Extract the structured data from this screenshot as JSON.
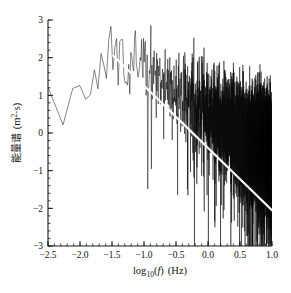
{
  "chart_data": {
    "type": "line",
    "title": "",
    "subtitle": "",
    "xlabel": "log_10(f)  (Hz)",
    "xlabel_parts": {
      "log": "log",
      "base": "10",
      "open": "(",
      "variable": "f",
      "close": ")",
      "unit": "(Hz)"
    },
    "ylabel": "能量谱 (m²·s)",
    "ylabel_parts": {
      "cjk": "能量谱",
      "unit_open": "(m",
      "unit_sup": "2",
      "unit_mid": "·s",
      "unit_close": ")"
    },
    "xlim": [
      -2.5,
      1.0
    ],
    "ylim": [
      -3,
      3
    ],
    "xticks": [
      -2.5,
      -2.0,
      -1.5,
      -1.0,
      -0.5,
      0.0,
      0.5,
      1.0
    ],
    "xtick_labels": [
      "-2.5",
      "-2.0",
      "-1.5",
      "-1.0",
      "-0.5",
      "0.0",
      "0.5",
      "1.0"
    ],
    "yticks": [
      -3,
      -2,
      -1,
      0,
      1,
      2,
      3
    ],
    "ytick_labels": [
      "-3",
      "-2",
      "-1",
      "0",
      "1",
      "2",
      "3"
    ],
    "x_minor_interval": 0.1,
    "y_minor_interval": 0.2,
    "grid": false,
    "legend": false,
    "series": [
      {
        "name": "energy-spectrum",
        "color": "#0a0a0a",
        "description": "noisy wave energy density spectrum",
        "peak_x": -1.5,
        "peak_y": 2.25,
        "start_x": -2.5,
        "start_y": 1.2,
        "end_x": 1.0,
        "end_y": -2.6,
        "envelope": [
          {
            "x": -2.5,
            "y": 1.2
          },
          {
            "x": -2.42,
            "y": 1.4
          },
          {
            "x": -2.35,
            "y": 0.95
          },
          {
            "x": -2.28,
            "y": 0.02
          },
          {
            "x": -2.2,
            "y": 0.7
          },
          {
            "x": -2.12,
            "y": 1.3
          },
          {
            "x": -2.05,
            "y": 1.05
          },
          {
            "x": -1.98,
            "y": 1.42
          },
          {
            "x": -1.92,
            "y": 0.9
          },
          {
            "x": -1.86,
            "y": 1.35
          },
          {
            "x": -1.8,
            "y": 1.55
          },
          {
            "x": -1.72,
            "y": 1.6
          },
          {
            "x": -1.64,
            "y": 1.85
          },
          {
            "x": -1.56,
            "y": 2.05
          },
          {
            "x": -1.5,
            "y": 2.25
          },
          {
            "x": -1.42,
            "y": 2.1
          },
          {
            "x": -1.34,
            "y": 2.18
          },
          {
            "x": -1.25,
            "y": 1.95
          },
          {
            "x": -1.15,
            "y": 1.9
          },
          {
            "x": -1.05,
            "y": 1.78
          },
          {
            "x": -0.95,
            "y": 1.6
          },
          {
            "x": -0.85,
            "y": 1.48
          },
          {
            "x": -0.75,
            "y": 1.4
          },
          {
            "x": -0.6,
            "y": 1.22
          },
          {
            "x": -0.45,
            "y": 1.05
          },
          {
            "x": -0.3,
            "y": 0.88
          },
          {
            "x": -0.15,
            "y": 0.7
          },
          {
            "x": 0.0,
            "y": 0.52
          },
          {
            "x": 0.2,
            "y": 0.3
          },
          {
            "x": 0.4,
            "y": 0.05
          },
          {
            "x": 0.6,
            "y": -0.18
          },
          {
            "x": 0.8,
            "y": -0.4
          },
          {
            "x": 1.0,
            "y": -0.6
          }
        ]
      },
      {
        "name": "fitted-slope-line",
        "color": "#ffffff",
        "type": "line",
        "x": [
          -1.48,
          1.0
        ],
        "y": [
          2.05,
          -2.05
        ],
        "slope": -1.65,
        "description": "white fitted power-law decay line"
      }
    ]
  }
}
